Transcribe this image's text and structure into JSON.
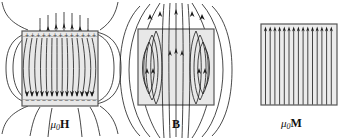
{
  "figure": {
    "background_color": "#ffffff",
    "line_color": "#1a1a1a",
    "magnet_fill": "#e8e8e8",
    "magnet_stroke": "#555555"
  },
  "panels": [
    {
      "id": "mu0H",
      "caption_mu": "μ",
      "caption_sub": "0",
      "caption_vector": "H",
      "caption_plain": "μ0H",
      "field_name": "demagnetizing-field",
      "interior_direction": "down",
      "top_surface_charge": "+",
      "bottom_surface_charge": "−",
      "surface_charge_count": 13,
      "interior_line_count": 13,
      "exterior_loop_count": 4
    },
    {
      "id": "B",
      "caption_mu": "",
      "caption_sub": "",
      "caption_vector": "B",
      "caption_plain": "B",
      "field_name": "magnetic-flux-density",
      "interior_direction": "up",
      "top_surface_charge": "",
      "bottom_surface_charge": "",
      "surface_charge_count": 0,
      "interior_line_count": 11,
      "exterior_loop_count": 5
    },
    {
      "id": "mu0M",
      "caption_mu": "μ",
      "caption_sub": "0",
      "caption_vector": "M",
      "caption_plain": "μ0M",
      "field_name": "magnetization",
      "interior_direction": "up",
      "top_surface_charge": "",
      "bottom_surface_charge": "",
      "surface_charge_count": 0,
      "interior_line_count": 16,
      "exterior_loop_count": 0
    }
  ]
}
